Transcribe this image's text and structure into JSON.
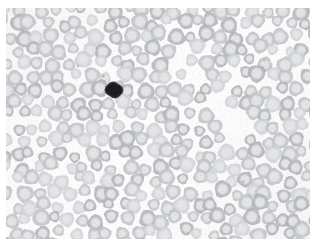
{
  "image": {
    "kind": "micrograph",
    "subject": "peripheral-blood-smear",
    "modality": "brightfield-light-microscopy",
    "width_px": 318,
    "height_px": 249,
    "field_background_color": "#fbfbfb",
    "border_margin_color": "#ffffff",
    "margins_px": {
      "left": 6,
      "top": 8,
      "right": 8,
      "bottom": 10
    },
    "field_bounds_px": {
      "x": 6,
      "y": 8,
      "width": 304,
      "height": 231
    }
  },
  "palette": {
    "background": "#fbfbfb",
    "slide_tint": "#f4f4f5",
    "erythrocyte_rim": "#c2c3c6",
    "erythrocyte_rim_dark": "#b4b5b9",
    "erythrocyte_rim_light": "#d2d3d6",
    "erythrocyte_pallor": "#e4e5e7",
    "leukocyte_nucleus": "#1d1d20",
    "leukocyte_nucleus_edge": "#3a3a3e",
    "platelet": "#b9babd",
    "debris_speck": "#9a9b9e"
  },
  "cell_field": {
    "erythrocyte_count": 368,
    "leukocyte_count": 1,
    "platelet_count": 5,
    "mean_erythrocyte_diameter_px": 14.5,
    "erythrocyte_diameter_range_px": [
      11,
      18
    ],
    "central_pallor_ratio": 0.46,
    "sparse_band": {
      "present": true,
      "description": "diagonal low-density streak from upper-mid toward lower-right",
      "from": [
        170,
        35
      ],
      "to": [
        252,
        150
      ],
      "half_width_px": 14
    },
    "seed": 20240917,
    "jitter_px": 4.0,
    "spacing_px": 15.2
  },
  "leukocyte": {
    "label": "dark-stained leukocyte",
    "center_px": [
      114,
      90
    ],
    "radius_px": 7.8,
    "shape": "round-irregular",
    "color": "#1d1d20"
  },
  "platelets": [
    {
      "center_px": [
        103,
        76
      ],
      "radius_px": 1.8
    },
    {
      "center_px": [
        196,
        131
      ],
      "radius_px": 1.6
    },
    {
      "center_px": [
        243,
        182
      ],
      "radius_px": 1.7
    },
    {
      "center_px": [
        78,
        66
      ],
      "radius_px": 1.4
    },
    {
      "center_px": [
        264,
        60
      ],
      "radius_px": 1.5
    }
  ]
}
